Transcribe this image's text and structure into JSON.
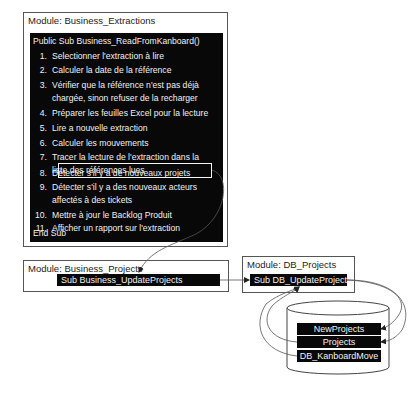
{
  "modules": {
    "extractions": {
      "title": "Module: Business_Extractions",
      "signature": "Public Sub Business_ReadFromKanboard()",
      "steps": [
        {
          "num": "1.",
          "lines": [
            "Selectionner l'extraction à lire"
          ]
        },
        {
          "num": "2.",
          "lines": [
            "Calculer la date de la référence"
          ]
        },
        {
          "num": "3.",
          "lines": [
            "Vérifier que la référence n'est pas déjà",
            "chargée, sinon refuser de la recharger"
          ]
        },
        {
          "num": "4.",
          "lines": [
            "Préparer les feuilles Excel pour la lecture"
          ]
        },
        {
          "num": "5.",
          "lines": [
            "Lire a nouvelle extraction"
          ]
        },
        {
          "num": "6.",
          "lines": [
            "Calculer les mouvements"
          ]
        },
        {
          "num": "7.",
          "lines": [
            "Tracer la lecture de l'extraction dans la",
            "liste des références lues"
          ]
        },
        {
          "num": "8.",
          "lines": [
            "Détecter s'il y a de nouveaux projets"
          ],
          "highlighted": true
        },
        {
          "num": "9.",
          "lines": [
            "Détecter s'il y a des nouveaux acteurs",
            "affectés à des tickets"
          ]
        },
        {
          "num": "10.",
          "lines": [
            "Mettre à jour le Backlog Produit"
          ]
        },
        {
          "num": "11.",
          "lines": [
            "Afficher un rapport sur l'extraction"
          ]
        }
      ],
      "end": "End Sub"
    },
    "projects": {
      "title": "Module: Business_Projects",
      "sub": "Sub Business_UpdateProjects"
    },
    "db_projects": {
      "title": "Module: DB_Projects",
      "sub": "Sub DB_UpdateProjects"
    }
  },
  "database": {
    "tables": [
      "NewProjects",
      "Projects",
      "DB_KanboardMove"
    ]
  },
  "colors": {
    "code_bg": "#080808",
    "code_fg": "#f2f2f2",
    "border": "#555555",
    "arrow": "#444444"
  }
}
